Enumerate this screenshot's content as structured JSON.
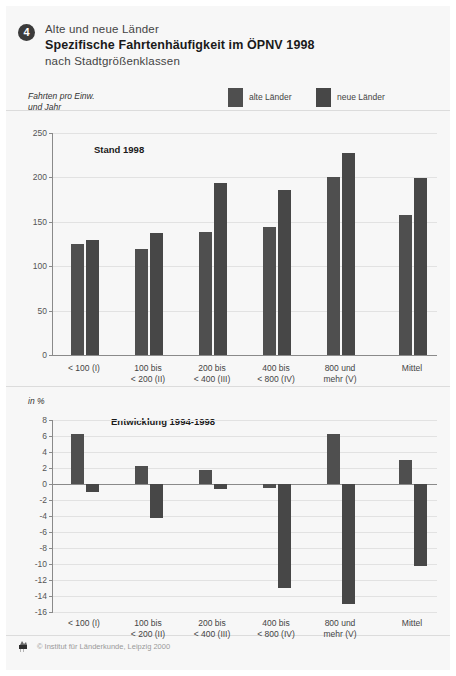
{
  "header": {
    "badge_number": "4",
    "supertitle": "Alte und neue Länder",
    "title": "Spezifische Fahrtenhäufigkeit im ÖPNV 1998",
    "subtitle": "nach Stadtgrößenklassen"
  },
  "legend": {
    "items": [
      {
        "label": "alte Länder",
        "color": "#4f4f4f"
      },
      {
        "label": "neue Länder",
        "color": "#474747"
      }
    ]
  },
  "footer": {
    "credit": "© Institut für Länderkunde, Leipzig 2000",
    "logo_icon": "institute-logo-icon"
  },
  "colors": {
    "panel_background": "#f7f7f7",
    "page_background": "#ffffff",
    "axis": "#8a8a8a",
    "grid": "#e2e2e2",
    "alte_laender": "#4f4f4f",
    "neue_laender": "#474747",
    "badge": "#3b3b3b"
  },
  "chart_data": [
    {
      "type": "bar",
      "id": "stand-1998",
      "title": "Stand 1998",
      "ylabel": "Fahrten pro Einw.\nund Jahr",
      "ylabel_line1": "Fahrten pro Einw.",
      "ylabel_line2": "und Jahr",
      "xlabel_line1": "Stadtgrößenklassen (Bedienungsgebiete)",
      "xlabel_line2": "Einwohner in Tsd.",
      "ylim": [
        0,
        250
      ],
      "yticks": [
        0,
        50,
        100,
        150,
        200,
        250
      ],
      "grid": true,
      "legend_position": "top-right",
      "categories": [
        "< 100 (I)",
        "100 bis\n< 200 (II)",
        "200 bis\n< 400 (III)",
        "400 bis\n< 800 (IV)",
        "800 und\nmehr (V)",
        "Mittel"
      ],
      "category_lines": [
        [
          "< 100 (I)",
          ""
        ],
        [
          "100 bis",
          "< 200 (II)"
        ],
        [
          "200 bis",
          "< 400 (III)"
        ],
        [
          "400 bis",
          "< 800 (IV)"
        ],
        [
          "800 und",
          "mehr (V)"
        ],
        [
          "Mittel",
          ""
        ]
      ],
      "series": [
        {
          "name": "alte Länder",
          "values": [
            125,
            119,
            138,
            144,
            201,
            158
          ]
        },
        {
          "name": "neue Länder",
          "values": [
            129,
            137,
            194,
            186,
            228,
            199
          ]
        }
      ]
    },
    {
      "type": "bar",
      "id": "entwicklung-1994-1998",
      "title": "Entwicklung 1994-1998",
      "ylabel": "in %",
      "ylim": [
        -16,
        8
      ],
      "yticks": [
        8,
        6,
        4,
        2,
        0,
        -2,
        -4,
        -6,
        -8,
        -10,
        -12,
        -14,
        -16
      ],
      "grid": true,
      "categories": [
        "< 100 (I)",
        "100 bis\n< 200 (II)",
        "200 bis\n< 400 (III)",
        "400 bis\n< 800 (IV)",
        "800 und\nmehr (V)",
        "Mittel"
      ],
      "category_lines": [
        [
          "< 100 (I)",
          ""
        ],
        [
          "100 bis",
          "< 200 (II)"
        ],
        [
          "200 bis",
          "< 400 (III)"
        ],
        [
          "400 bis",
          "< 800 (IV)"
        ],
        [
          "800 und",
          "mehr (V)"
        ],
        [
          "Mittel",
          ""
        ]
      ],
      "series": [
        {
          "name": "alte Länder",
          "values": [
            6.2,
            2.2,
            1.8,
            -0.5,
            6.2,
            3.0
          ]
        },
        {
          "name": "neue Länder",
          "values": [
            -1.0,
            -4.3,
            -0.6,
            -13.0,
            -15.0,
            -10.3
          ]
        }
      ]
    }
  ]
}
